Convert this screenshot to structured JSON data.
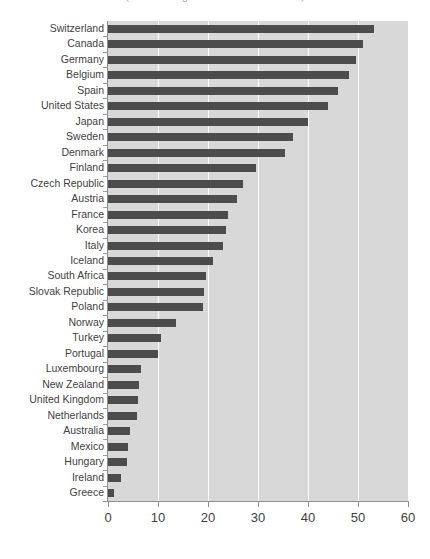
{
  "chart_data": {
    "type": "bar",
    "orientation": "horizontal",
    "title": "(Percent of Wage/Inflation Rate Indexed 2010)",
    "xlabel": "",
    "ylabel": "",
    "xlim": [
      0,
      60
    ],
    "xticks": [
      0,
      10,
      20,
      30,
      40,
      50,
      60
    ],
    "xtick_labels": [
      "0",
      "10",
      "20",
      "30",
      "40",
      "50",
      "60"
    ],
    "grid": true,
    "legend": "none",
    "bar_color": "#4c4c4c",
    "plot_background": "#d8d8d8",
    "categories": [
      "Switzerland",
      "Canada",
      "Germany",
      "Belgium",
      "Spain",
      "United States",
      "Japan",
      "Sweden",
      "Denmark",
      "Finland",
      "Czech Republic",
      "Austria",
      "France",
      "Korea",
      "Italy",
      "Iceland",
      "South Africa",
      "Slovak Republic",
      "Poland",
      "Norway",
      "Turkey",
      "Portugal",
      "Luxembourg",
      "New Zealand",
      "United Kingdom",
      "Netherlands",
      "Australia",
      "Mexico",
      "Hungary",
      "Ireland",
      "Greece"
    ],
    "values": [
      53.2,
      51.0,
      49.5,
      48.2,
      46.0,
      44.0,
      40.0,
      37.0,
      35.4,
      29.5,
      27.0,
      25.8,
      24.0,
      23.6,
      23.0,
      21.0,
      19.6,
      19.2,
      19.0,
      13.5,
      10.6,
      10.0,
      6.6,
      6.2,
      6.0,
      5.7,
      4.3,
      4.0,
      3.7,
      2.5,
      1.2
    ]
  }
}
